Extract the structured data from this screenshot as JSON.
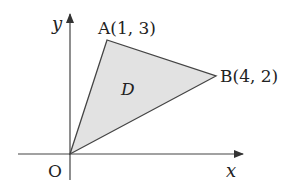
{
  "diagram": {
    "title": "",
    "axes": {
      "x_label": "x",
      "y_label": "y",
      "origin_label": "O"
    },
    "region": {
      "label": "D",
      "fill_color": "#e2e2e2",
      "stroke_color": "#444444",
      "vertices": [
        {
          "name": "O",
          "coords": [
            0,
            0
          ]
        },
        {
          "name": "A",
          "coords": [
            1,
            3
          ]
        },
        {
          "name": "B",
          "coords": [
            4,
            2
          ]
        }
      ]
    },
    "points": {
      "A": {
        "label": "A(1, 3)"
      },
      "B": {
        "label": "B(4, 2)"
      }
    }
  }
}
